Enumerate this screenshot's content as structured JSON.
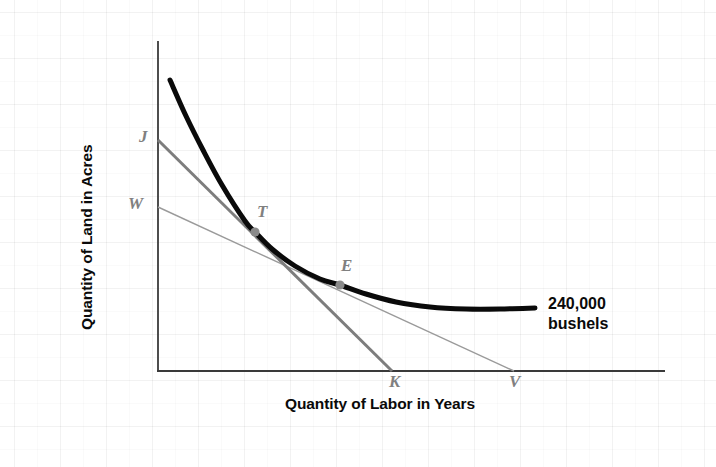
{
  "chart_data": {
    "type": "line",
    "title": "",
    "subtitle": "",
    "xlabel": "Quantity of Labor in Years",
    "ylabel": "Quantity of Land in Acres",
    "xlim": [
      0,
      100
    ],
    "ylim": [
      0,
      100
    ],
    "grid": false,
    "legend_position": "none",
    "annotations": [
      {
        "name": "isoquant-output-label",
        "line1": "240,000",
        "line2": "bushels",
        "text": "240,000 bushels",
        "x": 548,
        "y": 294
      }
    ],
    "series": [
      {
        "name": "isoquant",
        "label": "240,000 bushels",
        "type": "curve",
        "color": "#0a0a0a",
        "width": 5,
        "points": [
          [
            170,
            80
          ],
          [
            186,
            116
          ],
          [
            203,
            150
          ],
          [
            222,
            185
          ],
          [
            245,
            221
          ],
          [
            255,
            232
          ],
          [
            272,
            249
          ],
          [
            295,
            266
          ],
          [
            320,
            279
          ],
          [
            340,
            285
          ],
          [
            366,
            294
          ],
          [
            396,
            302
          ],
          [
            430,
            307
          ],
          [
            466,
            309
          ],
          [
            500,
            309
          ],
          [
            535,
            308
          ]
        ]
      },
      {
        "name": "isocost-line-JK",
        "label": "J to K",
        "type": "line",
        "color": "#7d7d7d",
        "width": 3,
        "from_label": "J",
        "to_label": "K",
        "from": [
          158,
          140
        ],
        "to": [
          392,
          371
        ],
        "tangent_point": "T"
      },
      {
        "name": "isocost-line-WV",
        "label": "W to V",
        "type": "line",
        "color": "#9a9a9a",
        "width": 1.4,
        "from_label": "W",
        "to_label": "V",
        "from": [
          158,
          207
        ],
        "to": [
          514,
          371
        ],
        "tangent_point": "E"
      }
    ],
    "points": [
      {
        "name": "point-T",
        "label": "T",
        "x": 255,
        "y": 232,
        "label_x": 258,
        "label_y": 204,
        "marker": "dot",
        "color": "#8a8a8a"
      },
      {
        "name": "point-E",
        "label": "E",
        "x": 340,
        "y": 285,
        "label_x": 341,
        "label_y": 258,
        "marker": "dot",
        "color": "#8a8a8a"
      }
    ],
    "axis_labels": [
      {
        "name": "axis-label-J",
        "label": "J",
        "x": 140,
        "y": 128,
        "axis": "y"
      },
      {
        "name": "axis-label-W",
        "label": "W",
        "x": 130,
        "y": 195,
        "axis": "y"
      },
      {
        "name": "axis-label-K",
        "label": "K",
        "x": 389,
        "y": 371,
        "axis": "x"
      },
      {
        "name": "axis-label-V",
        "label": "V",
        "x": 509,
        "y": 371,
        "axis": "x"
      }
    ],
    "axes": {
      "origin": [
        158,
        371
      ],
      "y_axis_top": [
        158,
        41
      ],
      "x_axis_right": [
        665,
        371
      ],
      "color": "#3a3a3a"
    },
    "colors": {
      "isoquant": "#0a0a0a",
      "isocost_steep": "#7d7d7d",
      "isocost_shallow": "#9a9a9a",
      "axis": "#3a3a3a",
      "point_marker": "#8a8a8a",
      "point_label": "#808080",
      "text": "#0a0a0a",
      "background": "#ffffff"
    }
  },
  "labels": {
    "y_axis_title": "Quantity of Land in Acres",
    "x_axis_title": "Quantity of Labor in Years",
    "point_J": "J",
    "point_W": "W",
    "point_T": "T",
    "point_E": "E",
    "point_K": "K",
    "point_V": "V",
    "output_line1": "240,000",
    "output_line2": "bushels"
  }
}
